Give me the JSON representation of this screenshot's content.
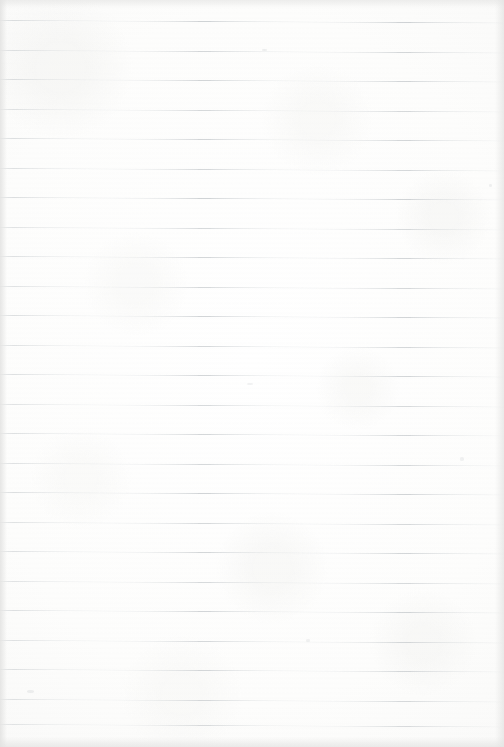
{
  "document": {
    "kind": "scanned-lined-paper",
    "description": "Blank sheet of ruled notebook paper, scanned",
    "text_content": "",
    "width_px": 504,
    "height_px": 747
  },
  "paper": {
    "background_color": "#fdfdfc",
    "center_color": "#ffffff",
    "edge_color": "#eaeae9",
    "has_margin_line": false,
    "has_holes": false,
    "has_handwriting": false
  },
  "ruling": {
    "line_color": "#c5c9cc",
    "line_color_faint": "#d8dcdf",
    "line_thickness_px": 1,
    "line_count": 24,
    "spacing_px": 29.5,
    "first_line_y": 20,
    "last_line_y": 724,
    "skew_px_across_width": 2.4,
    "lines_y": [
      20.0,
      49.5,
      79.0,
      108.5,
      138.0,
      167.5,
      197.0,
      226.5,
      256.0,
      285.5,
      315.0,
      344.5,
      374.0,
      403.5,
      433.0,
      462.5,
      492.0,
      521.5,
      551.0,
      580.5,
      610.0,
      639.5,
      669.0,
      698.5,
      724.0
    ],
    "opacities": [
      0.82,
      0.74,
      0.78,
      0.7,
      0.76,
      0.72,
      0.8,
      0.68,
      0.74,
      0.7,
      0.78,
      0.72,
      0.76,
      0.69,
      0.74,
      0.71,
      0.79,
      0.7,
      0.75,
      0.68,
      0.77,
      0.72,
      0.74,
      0.7,
      0.66
    ]
  },
  "artifacts": {
    "vignette": true,
    "scan_banding": true,
    "paper_grain": true,
    "speck_count": 6
  },
  "specks": [
    {
      "x": 262,
      "y": 49,
      "w": 5,
      "h": 2,
      "opacity": 0.16
    },
    {
      "x": 489,
      "y": 184,
      "w": 3,
      "h": 3,
      "opacity": 0.14
    },
    {
      "x": 247,
      "y": 383,
      "w": 6,
      "h": 2,
      "opacity": 0.13
    },
    {
      "x": 460,
      "y": 457,
      "w": 4,
      "h": 4,
      "opacity": 0.12
    },
    {
      "x": 306,
      "y": 639,
      "w": 4,
      "h": 3,
      "opacity": 0.13
    },
    {
      "x": 27,
      "y": 690,
      "w": 7,
      "h": 3,
      "opacity": 0.15
    }
  ]
}
